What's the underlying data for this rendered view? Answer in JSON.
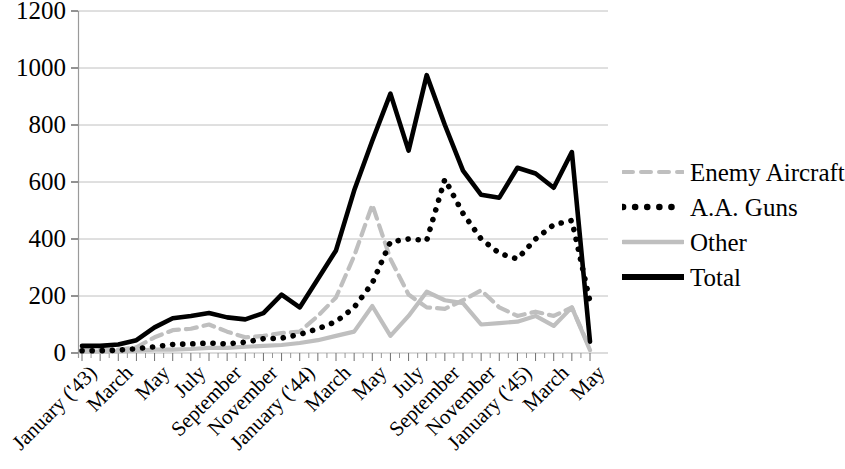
{
  "chart_data": {
    "type": "line",
    "title": "",
    "subtitle": "",
    "xlabel": "",
    "ylabel": "",
    "ylim": [
      0,
      1200
    ],
    "ytick_step": 200,
    "grid": "horizontal",
    "legend_position": "right",
    "ytick_labels": [
      "1200",
      "1000",
      "800",
      "600",
      "400",
      "200",
      "0"
    ],
    "x": [
      "January ('43)",
      "February",
      "March",
      "April",
      "May",
      "June",
      "July",
      "August",
      "September",
      "October",
      "November",
      "December",
      "January ('44)",
      "February",
      "March",
      "April",
      "May",
      "June",
      "July",
      "August",
      "September",
      "October",
      "November",
      "December",
      "January ('45)",
      "February",
      "March",
      "April",
      "May"
    ],
    "xtick_labels": [
      "January ('43)",
      "March",
      "May",
      "July",
      "September",
      "November",
      "January ('44)",
      "March",
      "May",
      "July",
      "September",
      "November",
      "January ('45)",
      "March",
      "May"
    ],
    "xtick_indices": [
      0,
      2,
      4,
      6,
      8,
      10,
      12,
      14,
      16,
      18,
      20,
      22,
      24,
      26,
      28
    ],
    "series": [
      {
        "name": "Enemy Aircraft",
        "style": "dashed",
        "color": "#bfbfbf",
        "values": [
          10,
          10,
          12,
          20,
          55,
          80,
          85,
          100,
          75,
          55,
          60,
          70,
          75,
          130,
          195,
          340,
          520,
          330,
          205,
          160,
          155,
          185,
          220,
          160,
          130,
          145,
          130,
          160,
          15
        ]
      },
      {
        "name": "A.A. Guns",
        "style": "dotted",
        "color": "#000000",
        "values": [
          8,
          8,
          10,
          15,
          22,
          30,
          32,
          35,
          32,
          38,
          50,
          52,
          65,
          85,
          110,
          160,
          245,
          390,
          400,
          395,
          610,
          490,
          400,
          350,
          330,
          400,
          450,
          465,
          180
        ]
      },
      {
        "name": "Other",
        "style": "solid",
        "color": "#bfbfbf",
        "values": [
          5,
          5,
          6,
          8,
          12,
          12,
          14,
          18,
          18,
          22,
          25,
          28,
          35,
          45,
          60,
          75,
          165,
          60,
          130,
          215,
          185,
          175,
          100,
          105,
          110,
          130,
          95,
          160,
          10
        ]
      },
      {
        "name": "Total",
        "style": "solid",
        "color": "#000000",
        "values": [
          25,
          25,
          30,
          45,
          90,
          122,
          130,
          140,
          125,
          118,
          140,
          205,
          160,
          260,
          360,
          570,
          745,
          910,
          710,
          975,
          800,
          640,
          555,
          545,
          650,
          630,
          580,
          705,
          40
        ]
      }
    ]
  }
}
